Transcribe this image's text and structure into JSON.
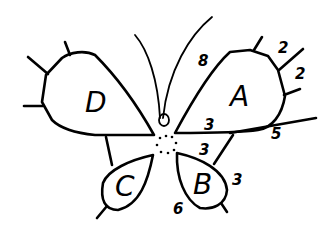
{
  "diagram": {
    "regions": [
      {
        "id": "A",
        "label": "A"
      },
      {
        "id": "B",
        "label": "B"
      },
      {
        "id": "C",
        "label": "C"
      },
      {
        "id": "D",
        "label": "D"
      }
    ],
    "numbers": {
      "antenna_8": "8",
      "A_top_2a": "2",
      "A_right_2b": "2",
      "A_bottom_3": "3",
      "A_edge_5": "5",
      "B_top_3": "3",
      "B_right_3": "3",
      "B_bottom_6": "6"
    }
  }
}
